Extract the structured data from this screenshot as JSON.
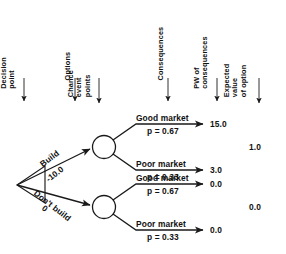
{
  "diagram": {
    "type": "decision-tree",
    "columns": [
      {
        "name": "decision-point",
        "lines": [
          "Decision",
          "point"
        ],
        "x": 24
      },
      {
        "name": "options",
        "lines": [
          "Options"
        ],
        "x": 75
      },
      {
        "name": "chance-event-points",
        "lines": [
          "Chance",
          "event",
          "points"
        ],
        "x": 99
      },
      {
        "name": "consequences",
        "lines": [
          "Consequences"
        ],
        "x": 168
      },
      {
        "name": "pw-of-consequences",
        "lines": [
          "PW of",
          "consequences"
        ],
        "x": 217
      },
      {
        "name": "expected-value-of-option",
        "lines": [
          "Expected",
          "value",
          "of option"
        ],
        "x": 259
      }
    ],
    "options": [
      {
        "label": "Build",
        "cost": "-10.0"
      },
      {
        "label": "Don't build",
        "cost": "0"
      }
    ],
    "outcomes": [
      {
        "market": "Good market",
        "prob": "p  = 0.67",
        "pw": "15.0"
      },
      {
        "market": "Poor market",
        "prob": "p  = 0.33",
        "pw": "3.0"
      },
      {
        "market": "Good market",
        "prob": "p  = 0.67",
        "pw": "0.0"
      },
      {
        "market": "Poor market",
        "prob": "p  = 0.33",
        "pw": "0.0"
      }
    ],
    "expected_values": [
      {
        "option": "Build",
        "value": "1.0"
      },
      {
        "option": "Don't build",
        "value": "0.0"
      }
    ]
  }
}
